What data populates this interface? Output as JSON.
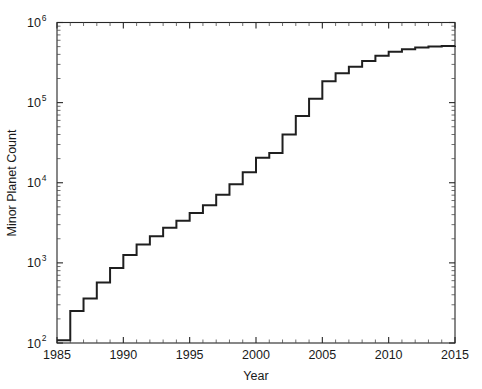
{
  "chart_data": {
    "type": "line",
    "title": "",
    "subtitle": "",
    "xlabel": "Year",
    "ylabel": "Minor Planet Count",
    "xlim": [
      1985,
      2015
    ],
    "ylim": [
      100,
      1000000
    ],
    "yscale": "log",
    "xscale": "linear",
    "grid": false,
    "legend": null,
    "drawstyle": "steps-post",
    "x_ticks": [
      1985,
      1990,
      1995,
      2000,
      2005,
      2010,
      2015
    ],
    "x_ticklabels": [
      "1985",
      "1990",
      "1995",
      "2000",
      "2005",
      "2010",
      "2015"
    ],
    "y_ticks": [
      100,
      1000,
      10000,
      100000,
      1000000
    ],
    "y_ticklabels": [
      "10^2",
      "10^3",
      "10^4",
      "10^5",
      "10^6"
    ],
    "y_tick_mantissa": [
      "10",
      "10",
      "10",
      "10",
      "10"
    ],
    "y_tick_exponent": [
      "2",
      "3",
      "4",
      "5",
      "6"
    ],
    "series": [
      {
        "name": "Minor Planet Count",
        "color": "#1f1f1f",
        "x": [
          1985,
          1986,
          1987,
          1988,
          1989,
          1990,
          1991,
          1992,
          1993,
          1994,
          1995,
          1996,
          1997,
          1998,
          1999,
          2000,
          2001,
          2002,
          2003,
          2004,
          2005,
          2006,
          2007,
          2008,
          2009,
          2010,
          2011,
          2012,
          2013,
          2014,
          2015
        ],
        "values": [
          108,
          250,
          360,
          570,
          860,
          1250,
          1700,
          2150,
          2750,
          3350,
          4200,
          5250,
          7100,
          9600,
          13500,
          20500,
          23500,
          40000,
          68000,
          112000,
          185000,
          232000,
          280000,
          330000,
          385000,
          430000,
          462000,
          487000,
          500000,
          508000,
          512000
        ]
      }
    ]
  },
  "axes": {
    "x_axis_name": "Year",
    "y_axis_name": "Minor Planet Count"
  }
}
